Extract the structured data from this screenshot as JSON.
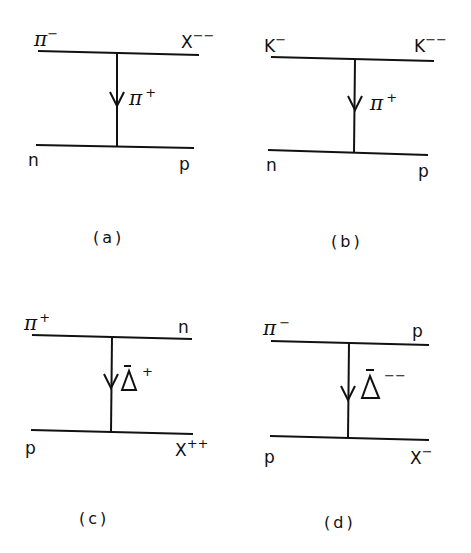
{
  "figure": {
    "panels": [
      {
        "id": "a",
        "caption": "(a)",
        "top_left": {
          "base": "π",
          "sup": "−"
        },
        "top_right": {
          "base": "X",
          "sup": "−−"
        },
        "exchange": {
          "base": "π",
          "sup": "+"
        },
        "bottom_left": {
          "base": "n",
          "sup": ""
        },
        "bottom_right": {
          "base": "p",
          "sup": ""
        }
      },
      {
        "id": "b",
        "caption": "(b)",
        "top_left": {
          "base": "K",
          "sup": "−"
        },
        "top_right": {
          "base": "K",
          "sup": "−−"
        },
        "exchange": {
          "base": "π",
          "sup": "+"
        },
        "bottom_left": {
          "base": "n",
          "sup": ""
        },
        "bottom_right": {
          "base": "p",
          "sup": ""
        }
      },
      {
        "id": "c",
        "caption": "(c)",
        "top_left": {
          "base": "π",
          "sup": "+"
        },
        "top_right": {
          "base": "n",
          "sup": ""
        },
        "exchange": {
          "base": "Δ̄",
          "sup": "+"
        },
        "bottom_left": {
          "base": "p",
          "sup": ""
        },
        "bottom_right": {
          "base": "X",
          "sup": "++"
        }
      },
      {
        "id": "d",
        "caption": "(d)",
        "top_left": {
          "base": "π",
          "sup": "−"
        },
        "top_right": {
          "base": "p",
          "sup": ""
        },
        "exchange": {
          "base": "Δ̄",
          "sup": "−−"
        },
        "bottom_left": {
          "base": "p",
          "sup": ""
        },
        "bottom_right": {
          "base": "X",
          "sup": "−"
        }
      }
    ],
    "colors": {
      "ink": "#111111",
      "paper": "#ffffff"
    }
  }
}
